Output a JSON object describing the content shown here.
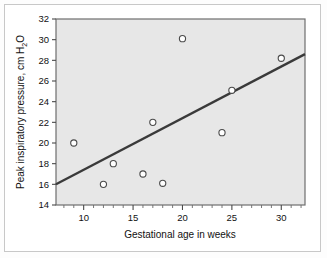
{
  "chart_data": {
    "type": "scatter",
    "title": "",
    "xlabel": "Gestational age in weeks",
    "ylabel": "Peak inspiratory pressure, cm H2O",
    "ylabel_parts": {
      "before": "Peak inspiratory pressure, cm H",
      "subscript": "2",
      "after": "O"
    },
    "xlim": [
      7.2,
      32.4
    ],
    "ylim": [
      14,
      32
    ],
    "xticks": [
      10,
      15,
      20,
      25,
      30
    ],
    "xtick_labels": [
      "10",
      "15",
      "20",
      "25",
      "30"
    ],
    "xminor_step": 1,
    "yticks": [
      14,
      16,
      18,
      20,
      22,
      24,
      26,
      28,
      30,
      32
    ],
    "ytick_labels": [
      "14",
      "16",
      "18",
      "20",
      "22",
      "24",
      "26",
      "28",
      "30",
      "32"
    ],
    "grid": false,
    "legend": null,
    "plot_background": "#e7e7e7",
    "marker": "open-circle",
    "marker_color": "#ffffff",
    "marker_edge_color": "#4a4a4a",
    "line_color": "#3a3a3a",
    "points": [
      {
        "x": 9,
        "y": 20.0
      },
      {
        "x": 12,
        "y": 16.0
      },
      {
        "x": 13,
        "y": 18.0
      },
      {
        "x": 16,
        "y": 17.0
      },
      {
        "x": 17,
        "y": 22.0
      },
      {
        "x": 18,
        "y": 16.1
      },
      {
        "x": 20,
        "y": 30.1
      },
      {
        "x": 24,
        "y": 21.0
      },
      {
        "x": 25,
        "y": 25.1
      },
      {
        "x": 30,
        "y": 28.2
      }
    ],
    "series": [
      {
        "name": "Observations",
        "x": [
          9,
          12,
          13,
          16,
          17,
          18,
          20,
          24,
          25,
          30
        ],
        "values": [
          20.0,
          16.0,
          18.0,
          17.0,
          22.0,
          16.1,
          30.1,
          21.0,
          25.1,
          28.2
        ]
      }
    ],
    "fit_line": {
      "name": "Least-squares regression line",
      "x_start": 7.2,
      "y_start": 16.0,
      "x_end": 32.4,
      "y_end": 28.6
    }
  }
}
